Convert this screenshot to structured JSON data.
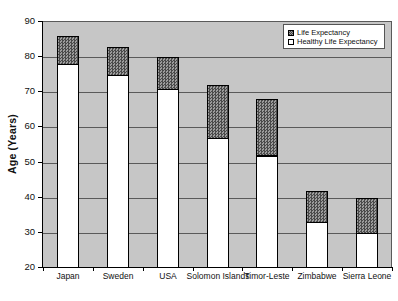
{
  "chart_data": {
    "type": "bar",
    "subtype": "overlapped-stack",
    "title": "",
    "xlabel": "",
    "ylabel": "Age (Years)",
    "ylim": [
      20,
      90
    ],
    "yticks": [
      20,
      30,
      40,
      50,
      60,
      70,
      80,
      90
    ],
    "grid": true,
    "legend_position": "top-right",
    "plot_background": "#c6c6c6",
    "categories": [
      "Japan",
      "Sweden",
      "USA",
      "Solomon Islands",
      "Timor-Leste",
      "Zimbabwe",
      "Sierra Leone"
    ],
    "series": [
      {
        "name": "Life Expectancy",
        "style": "hatched-gray",
        "values": [
          86,
          83,
          80,
          72,
          68,
          42,
          40
        ]
      },
      {
        "name": "Healthy Life Expectancy",
        "style": "white",
        "values": [
          78,
          75,
          71,
          57,
          52,
          33,
          30
        ]
      }
    ]
  },
  "legend": {
    "items": [
      {
        "label": "Life Expectancy",
        "swatch": "hatched"
      },
      {
        "label": "Healthy Life Expectancy",
        "swatch": "white"
      }
    ]
  }
}
